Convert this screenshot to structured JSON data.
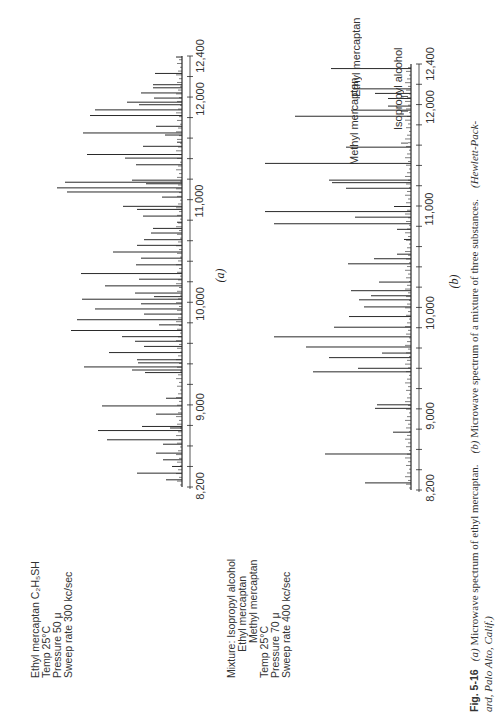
{
  "figure": {
    "number": "Fig. 5-16",
    "caption_line1": "(a) Microwave spectrum of ethyl mercaptan.   (b) Microwave spectrum of a mixture of three substances.   (Hewlett-Pack-",
    "caption_line2": "ard, Palo Alto, Calif.)",
    "caption_a": "(a)",
    "caption_a_text": "Microwave spectrum of ethyl mercaptan.",
    "caption_b": "(b)",
    "caption_b_text": "Microwave spectrum of a mixture of three substances.",
    "credit_line1": "(Hewlett-Pack-",
    "credit_line2": "ard, Palo Alto, Calif.)"
  },
  "panel_a": {
    "label": "(a)",
    "info": {
      "line1": "Ethyl mercaptan C₂H₅SH",
      "line2": "Temp 25°C",
      "line3": "Pressure 50 μ",
      "line4": "Sweep rate 300 kc/sec"
    }
  },
  "panel_b": {
    "label": "(b)",
    "info": {
      "line1": "Mixture: Isopropyl alcohol",
      "line2": "         Ethyl mercaptan",
      "line3": "            Methyl mercaptan",
      "line4": "Temp 25°C",
      "line5": "Pressure 70 μ",
      "line6": "Sweep rate 400 kc/sec"
    },
    "annotations": [
      "Methyl mercaptan",
      "Isopropyl alcohol",
      "Ethyl mercaptan"
    ]
  },
  "chart_data": [
    {
      "type": "bar",
      "title": "(a) Microwave spectrum of ethyl mercaptan",
      "xlabel": "Frequency (Mc)",
      "ylabel": "Absorption (relative)",
      "xlim": [
        8200,
        12400
      ],
      "x_ticks": [
        "8,200",
        "9,000",
        "10,000",
        "11,000",
        "12,000",
        "12,400"
      ],
      "minor_tick_step": 200,
      "grid": false,
      "x": [
        8270,
        8335,
        8400,
        8465,
        8530,
        8617,
        8660,
        8775,
        8790,
        8750,
        8910,
        8990,
        9065,
        9315,
        9370,
        9340,
        9410,
        9440,
        9510,
        9570,
        9620,
        9665,
        9725,
        9780,
        9830,
        9885,
        9935,
        9985,
        10030,
        10055,
        10090,
        10160,
        10225,
        10280,
        10365,
        10430,
        10490,
        10555,
        10610,
        10675,
        10720,
        10780,
        10840,
        10905,
        10935,
        11025,
        11075,
        11115,
        11170,
        11190,
        11155,
        11340,
        11405,
        11440,
        11520,
        11560,
        11630,
        11650,
        11715,
        11820,
        11875,
        11925,
        11950,
        11990,
        12040,
        12090,
        12120,
        12230,
        12390
      ],
      "values": [
        16,
        45,
        10,
        19,
        26,
        19,
        75,
        12,
        40,
        84,
        26,
        80,
        16,
        37,
        98,
        50,
        44,
        45,
        73,
        38,
        47,
        60,
        111,
        23,
        105,
        38,
        87,
        41,
        100,
        28,
        47,
        77,
        43,
        101,
        46,
        41,
        69,
        45,
        38,
        31,
        29,
        5,
        39,
        45,
        59,
        20,
        115,
        125,
        117,
        50,
        36,
        46,
        57,
        95,
        39,
        5,
        17,
        99,
        26,
        92,
        87,
        43,
        55,
        28,
        41,
        29,
        29,
        27,
        6
      ]
    },
    {
      "type": "bar",
      "title": "(b) Microwave spectrum of a mixture of three substances",
      "xlabel": "Frequency (Mc)",
      "ylabel": "Absorption (relative)",
      "xlim": [
        8200,
        12400
      ],
      "x_ticks": [
        "8,200",
        "9,000",
        "10,000",
        "11,000",
        "12,000",
        "12,400"
      ],
      "minor_tick_step": 200,
      "grid": false,
      "annotations": [
        {
          "text": "Methyl mercaptan",
          "x": 11620
        },
        {
          "text": "Isopropyl alcohol",
          "x": 11935
        },
        {
          "text": "Ethyl mercaptan",
          "x": 12080
        }
      ],
      "x": [
        8270,
        8555,
        8770,
        9005,
        9040,
        9365,
        9400,
        9505,
        9550,
        9610,
        9710,
        9805,
        9910,
        10005,
        10075,
        10115,
        10165,
        10250,
        10430,
        10480,
        10525,
        10670,
        10770,
        10825,
        10890,
        10945,
        10995,
        11175,
        11230,
        11255,
        11420,
        11580,
        11885,
        11945,
        11985,
        12060,
        12110,
        12155,
        12355
      ],
      "values": [
        46,
        86,
        18,
        36,
        34,
        98,
        53,
        82,
        29,
        105,
        137,
        77,
        62,
        47,
        52,
        40,
        60,
        32,
        63,
        37,
        14,
        7,
        14,
        137,
        56,
        146,
        17,
        65,
        79,
        82,
        146,
        65,
        116,
        60,
        23,
        23,
        36,
        58,
        80
      ]
    }
  ]
}
